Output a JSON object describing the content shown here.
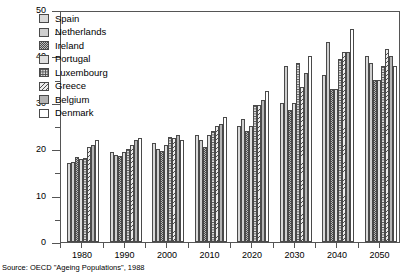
{
  "source_note": "Source: OECD \"Ageing Populations\", 1988",
  "legend": {
    "position": "top-left-inside",
    "items": [
      {
        "label": "Spain",
        "pattern": "crosshatch-grid",
        "key": "spain"
      },
      {
        "label": "Netherlands",
        "pattern": "dense-dots",
        "key": "netherlands"
      },
      {
        "label": "Ireland",
        "pattern": "checkerboard",
        "key": "ireland"
      },
      {
        "label": "Portugal",
        "pattern": "sparse-dots",
        "key": "portugal"
      },
      {
        "label": "Luxembourg",
        "pattern": "crosshatch-grid",
        "key": "luxembourg"
      },
      {
        "label": "Greece",
        "pattern": "diagonal-lines",
        "key": "greece"
      },
      {
        "label": "Belgium",
        "pattern": "solid-gray",
        "key": "belgium"
      },
      {
        "label": "Denmark",
        "pattern": "blank-white",
        "key": "denmark"
      }
    ]
  },
  "chart_data": {
    "type": "bar",
    "title": "",
    "subtitle": "",
    "xlabel": "",
    "ylabel": "",
    "categories": [
      "1980",
      "1990",
      "2000",
      "2010",
      "2020",
      "2030",
      "2040",
      "2050"
    ],
    "ylim": [
      0,
      50
    ],
    "ytick_labels": [
      "0",
      "10",
      "20",
      "30",
      "40",
      "50"
    ],
    "ytick_values": [
      0,
      10,
      20,
      30,
      40,
      50
    ],
    "yminor_values": [
      5,
      15,
      25,
      35,
      45
    ],
    "grid": false,
    "legend_position": "upper left",
    "series": [
      {
        "name": "Spain",
        "values": [
          17.0,
          19.3,
          21.4,
          23.0,
          25.0,
          30.0,
          36.0,
          40.0
        ]
      },
      {
        "name": "Netherlands",
        "values": [
          17.2,
          18.8,
          20.0,
          22.0,
          26.5,
          38.0,
          43.0,
          38.5
        ]
      },
      {
        "name": "Ireland",
        "values": [
          18.3,
          18.5,
          19.6,
          20.5,
          24.0,
          28.5,
          33.0,
          35.0
        ]
      },
      {
        "name": "Portugal",
        "values": [
          17.8,
          19.5,
          21.0,
          23.0,
          25.0,
          30.0,
          33.0,
          35.0
        ]
      },
      {
        "name": "Luxembourg",
        "values": [
          18.0,
          20.0,
          22.6,
          24.0,
          29.5,
          38.5,
          39.5,
          38.0
        ]
      },
      {
        "name": "Greece",
        "values": [
          20.5,
          21.0,
          22.5,
          25.0,
          29.5,
          33.5,
          41.0,
          41.5
        ]
      },
      {
        "name": "Belgium",
        "values": [
          21.0,
          22.0,
          23.0,
          25.5,
          30.5,
          36.5,
          41.0,
          40.0
        ]
      },
      {
        "name": "Denmark",
        "values": [
          22.0,
          22.5,
          22.0,
          27.0,
          32.5,
          40.0,
          46.0,
          38.0
        ]
      }
    ]
  }
}
